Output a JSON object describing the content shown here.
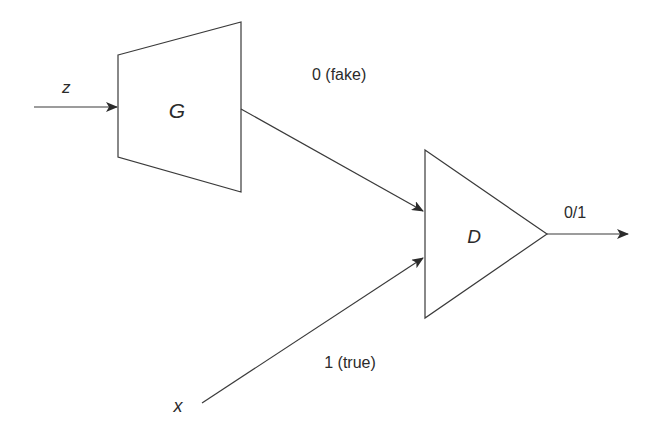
{
  "diagram": {
    "colors": {
      "stroke": "#3a3a3a",
      "text": "#2b2b2b",
      "background": "#ffffff"
    },
    "nodes": [
      {
        "id": "G",
        "label": "G",
        "shape": "trapezoid",
        "role": "generator"
      },
      {
        "id": "D",
        "label": "D",
        "shape": "triangle",
        "role": "discriminator"
      }
    ],
    "inputs": {
      "z": "z",
      "x": "x"
    },
    "edges": [
      {
        "from": "z",
        "to": "G",
        "label": ""
      },
      {
        "from": "G",
        "to": "D",
        "label": "0 (fake)"
      },
      {
        "from": "x",
        "to": "D",
        "label": "1 (true)"
      },
      {
        "from": "D",
        "to": "output",
        "label": "0/1"
      }
    ]
  }
}
